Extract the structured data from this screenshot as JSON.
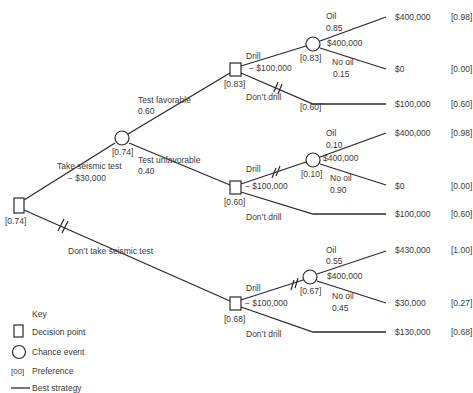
{
  "nodes": {
    "root": {
      "type": "decision",
      "pref": "[0.74]"
    },
    "test_chance": {
      "type": "chance",
      "pref": "[0.74]"
    },
    "fav_decision": {
      "type": "decision",
      "pref": "[0.83]"
    },
    "fav_chance": {
      "type": "chance",
      "pref": "[0.83]"
    },
    "unfav_decision": {
      "type": "decision",
      "pref": "[0.60]"
    },
    "unfav_chance": {
      "type": "chance",
      "pref": "[0.10]"
    },
    "notest_decision": {
      "type": "decision",
      "pref": "[0.68]"
    },
    "notest_chance": {
      "type": "chance",
      "pref": "[0.67]"
    }
  },
  "branches": {
    "take_test": {
      "label": "Take seismic test",
      "cost": "− $30,000"
    },
    "no_test": {
      "label": "Don’t take seismic test"
    },
    "favorable": {
      "label": "Test favorable",
      "prob": "0.60"
    },
    "unfavorable": {
      "label": "Test unfavorable",
      "prob": "0.40"
    },
    "fav_drill": {
      "label": "Drill",
      "cost": "− $100,000"
    },
    "fav_dont": {
      "label": "Don’t drill",
      "pref": "[0.60]"
    },
    "fav_oil": {
      "label": "Oil",
      "prob": "0.85",
      "value": "$400,000"
    },
    "fav_nooil": {
      "label": "No oil",
      "prob": "0.15"
    },
    "unfav_drill": {
      "label": "Drill",
      "cost": "− $100,000"
    },
    "unfav_dont": {
      "label": "Don’t drill"
    },
    "unfav_oil": {
      "label": "Oil",
      "prob": "0.10",
      "value": "$400,000"
    },
    "unfav_nooil": {
      "label": "No oil",
      "prob": "0.90"
    },
    "notest_drill": {
      "label": "Drill",
      "cost": "− $100,000"
    },
    "notest_dont": {
      "label": "Don’t drill"
    },
    "notest_oil": {
      "label": "Oil",
      "prob": "0.55",
      "value": "$400,000"
    },
    "notest_nooil": {
      "label": "No oil",
      "prob": "0.45"
    }
  },
  "outcomes": [
    {
      "payoff": "$400,000",
      "pref": "[0.98]"
    },
    {
      "payoff": "$0",
      "pref": "[0.00]"
    },
    {
      "payoff": "$100,000",
      "pref": "[0.60]"
    },
    {
      "payoff": "$400,000",
      "pref": "[0.98]"
    },
    {
      "payoff": "$0",
      "pref": "[0.00]"
    },
    {
      "payoff": "$100,000",
      "pref": "[0.60]"
    },
    {
      "payoff": "$430,000",
      "pref": "[1.00]"
    },
    {
      "payoff": "$30,000",
      "pref": "[0.27]"
    },
    {
      "payoff": "$130,000",
      "pref": "[0.68]"
    }
  ],
  "key": {
    "title": "Key",
    "decision": "Decision point",
    "chance": "Chance event",
    "pref_symbol": "[00]",
    "preference": "Preference",
    "best": "Best strategy"
  }
}
